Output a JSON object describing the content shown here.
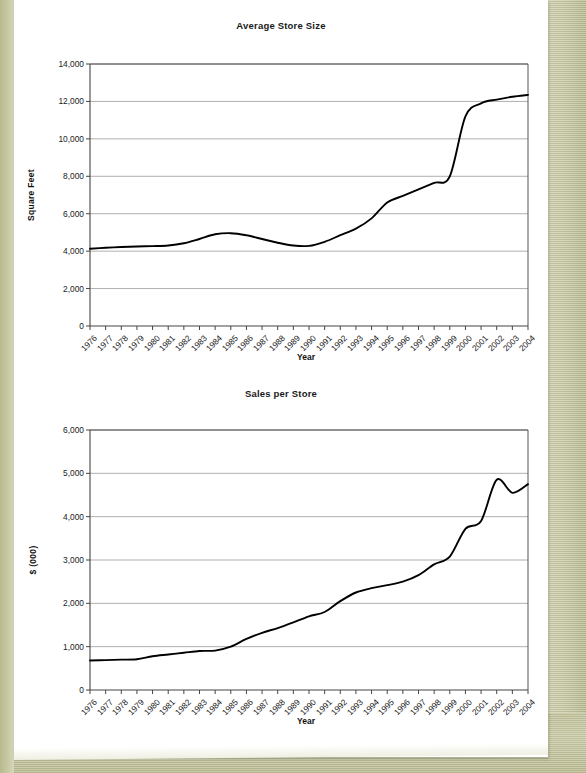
{
  "page": {
    "background_color": "#c9c9a2",
    "paper_color": "#ffffff"
  },
  "chart_data": [
    {
      "id": "average-store-size",
      "type": "line",
      "title": "Average Store Size",
      "xlabel": "Year",
      "ylabel": "Square Feet",
      "ylim": [
        0,
        14000
      ],
      "ytick_values": [
        0,
        2000,
        4000,
        6000,
        8000,
        10000,
        12000,
        14000
      ],
      "ytick_labels": [
        "0",
        "2,000",
        "4,000",
        "6,000",
        "8,000",
        "10,000",
        "12,000",
        "14,000"
      ],
      "grid": true,
      "legend": "none",
      "categories": [
        "1976",
        "1977",
        "1978",
        "1979",
        "1980",
        "1981",
        "1982",
        "1983",
        "1984",
        "1985",
        "1986",
        "1987",
        "1988",
        "1989",
        "1990",
        "1991",
        "1992",
        "1993",
        "1994",
        "1995",
        "1996",
        "1997",
        "1998",
        "1999",
        "2000",
        "2001",
        "2002",
        "2003",
        "2004"
      ],
      "values": [
        4130,
        4180,
        4220,
        4250,
        4270,
        4300,
        4420,
        4650,
        4900,
        4960,
        4850,
        4650,
        4450,
        4300,
        4280,
        4500,
        4850,
        5200,
        5750,
        6600,
        6950,
        7300,
        7650,
        8000,
        11200,
        11900,
        12100,
        12250,
        12350
      ]
    },
    {
      "id": "sales-per-store",
      "type": "line",
      "title": "Sales per Store",
      "xlabel": "Year",
      "ylabel": "$ (000)",
      "ylim": [
        0,
        6000
      ],
      "ytick_values": [
        0,
        1000,
        2000,
        3000,
        4000,
        5000,
        6000
      ],
      "ytick_labels": [
        "0",
        "1,000",
        "2,000",
        "3,000",
        "4,000",
        "5,000",
        "6,000"
      ],
      "grid": true,
      "legend": "none",
      "categories": [
        "1976",
        "1977",
        "1978",
        "1979",
        "1980",
        "1981",
        "1982",
        "1983",
        "1984",
        "1985",
        "1986",
        "1987",
        "1988",
        "1989",
        "1990",
        "1991",
        "1992",
        "1993",
        "1994",
        "1995",
        "1996",
        "1997",
        "1998",
        "1999",
        "2000",
        "2001",
        "2002",
        "2003",
        "2004"
      ],
      "values": [
        680,
        690,
        700,
        710,
        780,
        820,
        860,
        900,
        910,
        1000,
        1180,
        1320,
        1430,
        1560,
        1700,
        1800,
        2050,
        2250,
        2350,
        2420,
        2500,
        2650,
        2900,
        3080,
        3720,
        3900,
        4850,
        4550,
        4750,
        5250,
        5480
      ]
    }
  ]
}
